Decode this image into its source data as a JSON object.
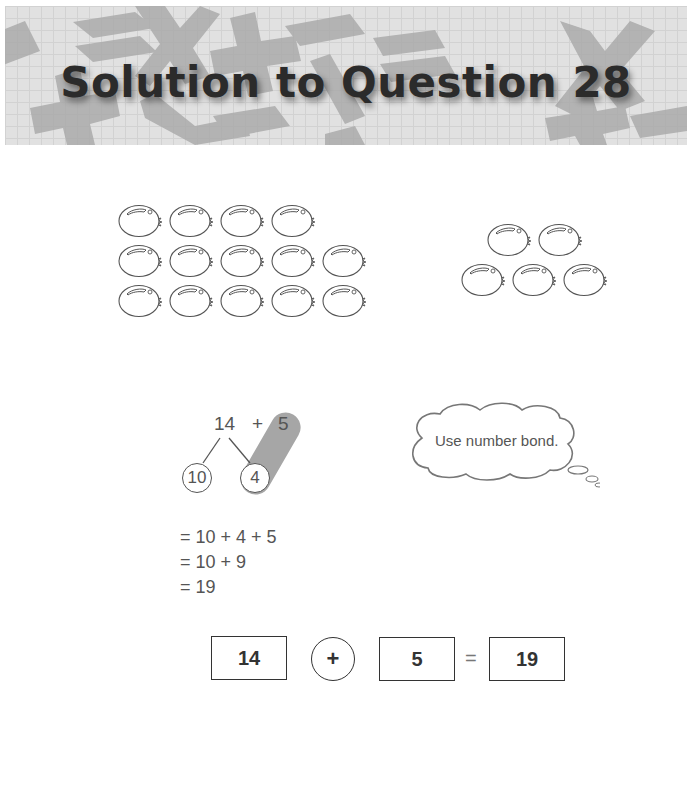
{
  "header": {
    "title": "Solution to Question 28",
    "background_symbols": [
      "plus",
      "equals",
      "times",
      "plus",
      "minus",
      "equals",
      "times",
      "divide",
      "minus",
      "plus",
      "minus",
      "minus"
    ]
  },
  "fruits": {
    "group_a": {
      "rows": [
        4,
        5,
        5
      ],
      "total": 14
    },
    "group_b": {
      "rows": [
        2,
        3
      ],
      "total": 5
    }
  },
  "number_bond": {
    "whole": "14",
    "operator": "+",
    "addend": "5",
    "parts": [
      "10",
      "4"
    ]
  },
  "thought_bubble": {
    "text": "Use number bond."
  },
  "steps": [
    "= 10 + 4 + 5",
    "= 10 + 9",
    "= 19"
  ],
  "equation": {
    "left": "14",
    "operator": "+",
    "right": "5",
    "equals": "=",
    "result": "19"
  },
  "colors": {
    "header_bg": "#e1e1e1",
    "symbol_gray": "#a9a9a9",
    "title_text": "#2b2b2b",
    "highlight_pill": "#a6a6a6"
  }
}
